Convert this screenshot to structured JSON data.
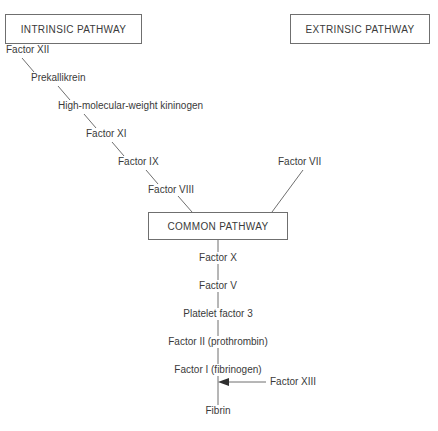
{
  "diagram": {
    "background": "#ffffff",
    "line_color": "#6f6f6f",
    "text_color": "#3a3a3a",
    "headers": [
      {
        "id": "intrinsic",
        "label": "INTRINSIC PATHWAY"
      },
      {
        "id": "extrinsic",
        "label": "EXTRINSIC PATHWAY"
      }
    ],
    "common_box": {
      "id": "common",
      "label": "COMMON PATHWAY"
    },
    "intrinsic_chain": [
      {
        "id": "factor-xii",
        "label": "Factor XII"
      },
      {
        "id": "prekallikrein",
        "label": "Prekallikrein"
      },
      {
        "id": "hmw-kininogen",
        "label": "High-molecular-weight kininogen"
      },
      {
        "id": "factor-xi",
        "label": "Factor XI"
      },
      {
        "id": "factor-ix",
        "label": "Factor IX"
      },
      {
        "id": "factor-viii",
        "label": "Factor VIII"
      }
    ],
    "extrinsic_chain": [
      {
        "id": "factor-vii",
        "label": "Factor VII"
      }
    ],
    "common_chain": [
      {
        "id": "factor-x",
        "label": "Factor X"
      },
      {
        "id": "factor-v",
        "label": "Factor V"
      },
      {
        "id": "platelet-factor-3",
        "label": "Platelet factor 3"
      },
      {
        "id": "factor-ii",
        "label": "Factor II (prothrombin)"
      },
      {
        "id": "factor-i",
        "label": "Factor I (fibrinogen)"
      },
      {
        "id": "fibrin",
        "label": "Fibrin"
      }
    ],
    "cofactors": [
      {
        "id": "factor-xiii",
        "label": "Factor XIII"
      }
    ]
  }
}
